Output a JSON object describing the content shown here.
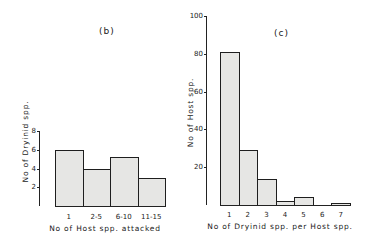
{
  "chart_data": [
    {
      "type": "bar",
      "title": "(b)",
      "categories": [
        "1",
        "2-5",
        "6-10",
        "11-15"
      ],
      "values": [
        6,
        4,
        5.2,
        3
      ],
      "xlabel": "No of Host spp. attacked",
      "ylabel": "No of Dryinid spp.",
      "yticks": [
        2,
        4,
        6,
        8
      ],
      "ylim": [
        0,
        8
      ],
      "grid": false
    },
    {
      "type": "bar",
      "title": "(c)",
      "categories": [
        "1",
        "2",
        "3",
        "4",
        "5",
        "6",
        "7"
      ],
      "values": [
        81,
        29,
        14,
        2,
        4,
        0,
        1
      ],
      "xlabel": "No of Dryinid spp. per Host spp.",
      "ylabel": "No of Host spp.",
      "yticks": [
        20,
        40,
        60,
        80,
        100
      ],
      "ylim": [
        0,
        100
      ],
      "grid": false
    }
  ],
  "colors": {
    "bar_fill": "#e6e6e4",
    "bar_edge": "#1e1e1e",
    "axis": "#222222"
  }
}
